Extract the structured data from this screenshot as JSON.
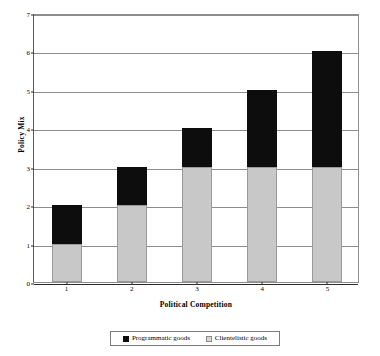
{
  "chart_data": {
    "type": "bar",
    "subtype": "stacked-bar",
    "title": "",
    "xlabel": "Political Competition",
    "ylabel": "Policy Mix",
    "categories": [
      "1",
      "2",
      "3",
      "4",
      "5"
    ],
    "series": [
      {
        "name": "Clientelistic goods",
        "color": "#c8c8c8",
        "values": [
          1,
          2,
          3,
          3,
          3
        ]
      },
      {
        "name": "Programmatic goods",
        "color": "#0d0d0d",
        "values": [
          1,
          1,
          1,
          2,
          3
        ]
      }
    ],
    "totals": [
      2,
      3,
      4,
      5,
      6
    ],
    "ylim": [
      0,
      7
    ],
    "ytick_labels": [
      "0",
      "1",
      "2",
      "3",
      "4",
      "5",
      "6",
      "7"
    ],
    "ytick_values": [
      0,
      1,
      2,
      3,
      4,
      5,
      6,
      7
    ],
    "xtick_labels": [
      "1",
      "2",
      "3",
      "4",
      "5"
    ],
    "grid": true,
    "grid_axis": "y",
    "legend_position": "bottom",
    "legend_entries": [
      "Programmatic goods",
      "Clientelistic goods"
    ],
    "plot_background": "#ffffff",
    "axis_color": "#8d8d8d"
  },
  "legend": {
    "programmatic_label": "Programmatic goods",
    "clientelistic_label": "Clientelistic goods"
  },
  "axes": {
    "x_title": "Political Competition",
    "y_title": "Policy Mix"
  }
}
